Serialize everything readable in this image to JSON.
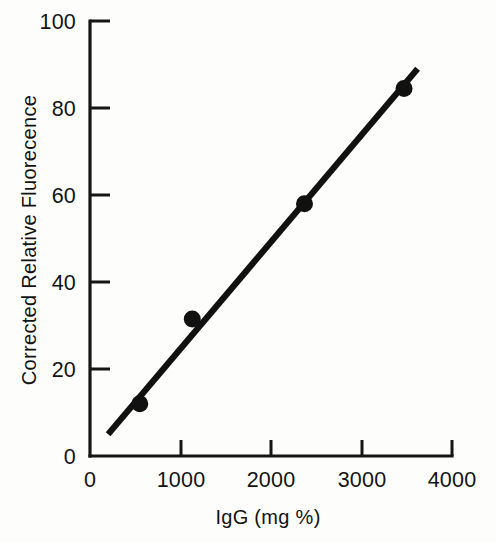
{
  "chart_data": {
    "type": "scatter",
    "title": "",
    "subtitle": "",
    "xlabel": "IgG (mg %)",
    "ylabel": "Corrected Relative Fluorecence",
    "xlim": [
      0,
      4000
    ],
    "ylim": [
      0,
      100
    ],
    "x_ticks": [
      0,
      1000,
      2000,
      3000,
      4000
    ],
    "y_ticks": [
      0,
      20,
      40,
      60,
      80,
      100
    ],
    "x_tick_labels": [
      "0",
      "1000",
      "2000",
      "3000",
      "4000"
    ],
    "y_tick_labels": [
      "0",
      "20",
      "40",
      "60",
      "80",
      "100"
    ],
    "grid": false,
    "legend": null,
    "legend_position": "none",
    "marker_style": "filled-circle",
    "marker_color": "#111111",
    "line_color": "#111111",
    "axis_color": "#151515",
    "background_color": "#fdfdfc",
    "series": [
      {
        "name": "IgG standard curve",
        "points": [
          {
            "x": 550,
            "y": 12
          },
          {
            "x": 1130,
            "y": 31.5
          },
          {
            "x": 2370,
            "y": 58
          },
          {
            "x": 3470,
            "y": 84.5
          }
        ]
      }
    ],
    "fit_line": {
      "name": "linear regression",
      "x_start": 200,
      "y_start": 5,
      "x_end": 3620,
      "y_end": 89
    }
  },
  "axes": {
    "y_title": "Corrected Relative Fluorecence",
    "x_title": "IgG (mg %)"
  },
  "figure": {
    "caption": ""
  }
}
